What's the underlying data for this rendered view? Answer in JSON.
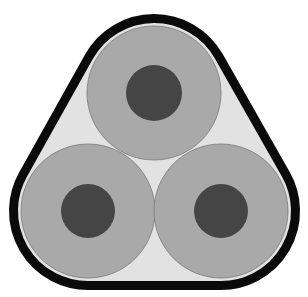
{
  "diagram": {
    "colors": {
      "background": "#ffffff",
      "sheath": "#0a0a0a",
      "filler": "#e2e2e2",
      "insulation": "#a9a9a9",
      "insulation_edge": "#7a7a7a",
      "conductor": "#454545"
    },
    "sheath": {
      "stroke_width": 9
    },
    "cores": [
      {
        "name": "top",
        "cx": 154,
        "cy": 93,
        "r_insulation": 67,
        "r_conductor": 28
      },
      {
        "name": "bottom-left",
        "cx": 88,
        "cy": 211,
        "r_insulation": 67,
        "r_conductor": 27
      },
      {
        "name": "bottom-right",
        "cx": 221,
        "cy": 211,
        "r_insulation": 67,
        "r_conductor": 27
      }
    ]
  }
}
